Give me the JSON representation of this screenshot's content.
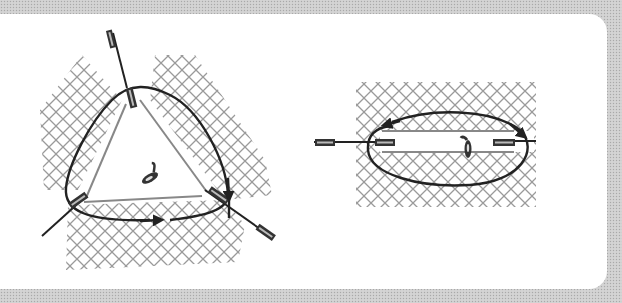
{
  "figure": {
    "description": "Suture loop diagrams over hatched tissue",
    "colors": {
      "background_border": "#cfcfcf",
      "card": "#ffffff",
      "hatch": "#9a9a9a",
      "suture": "#222222",
      "wound_edge": "#888888"
    },
    "panels": [
      {
        "id": "left",
        "label": "Triangular purse-string loop",
        "anchors": 3,
        "arrows": 2,
        "shape": "triangle"
      },
      {
        "id": "right",
        "label": "Elliptical loop across linear wound",
        "anchors": 3,
        "arrows": 2,
        "shape": "ellipse"
      }
    ]
  }
}
